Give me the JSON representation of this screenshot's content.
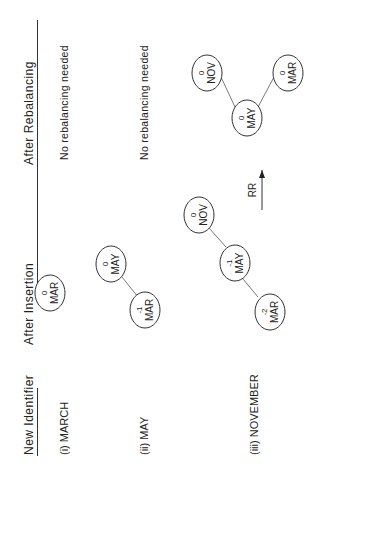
{
  "headers": {
    "new_identifier": "New Identifier",
    "after_insertion": "After Insertion",
    "after_rebalancing": "After Rebalancing"
  },
  "rows": [
    {
      "label": "(i) MARCH",
      "insertion_tree": [
        {
          "id": "MAR",
          "balance": "0"
        }
      ],
      "rebalancing": "No rebalancing needed"
    },
    {
      "label": "(ii) MAY",
      "insertion_tree": [
        {
          "id": "MAR",
          "balance": "-1"
        },
        {
          "id": "MAY",
          "balance": "0"
        }
      ],
      "rebalancing": "No rebalancing needed"
    },
    {
      "label": "(iii) NOVEMBER",
      "insertion_tree": [
        {
          "id": "MAR",
          "balance": "-2"
        },
        {
          "id": "MAY",
          "balance": "-1"
        },
        {
          "id": "NOV",
          "balance": "0"
        }
      ],
      "rotation": "RR",
      "rebalanced_tree": [
        {
          "id": "MAY",
          "balance": "0"
        },
        {
          "id": "MAR",
          "balance": "0"
        },
        {
          "id": "NOV",
          "balance": "0"
        }
      ]
    }
  ],
  "nodes": {
    "r1_mar": {
      "id": "MAR",
      "bal": "0"
    },
    "r2_mar": {
      "id": "MAR",
      "bal": "-1"
    },
    "r2_may": {
      "id": "MAY",
      "bal": "0"
    },
    "r3_mar": {
      "id": "MAR",
      "bal": "-2"
    },
    "r3_may": {
      "id": "MAY",
      "bal": "-1"
    },
    "r3_nov": {
      "id": "NOV",
      "bal": "0"
    },
    "rb_may": {
      "id": "MAY",
      "bal": "0"
    },
    "rb_mar": {
      "id": "MAR",
      "bal": "0"
    },
    "rb_nov": {
      "id": "NOV",
      "bal": "0"
    }
  }
}
